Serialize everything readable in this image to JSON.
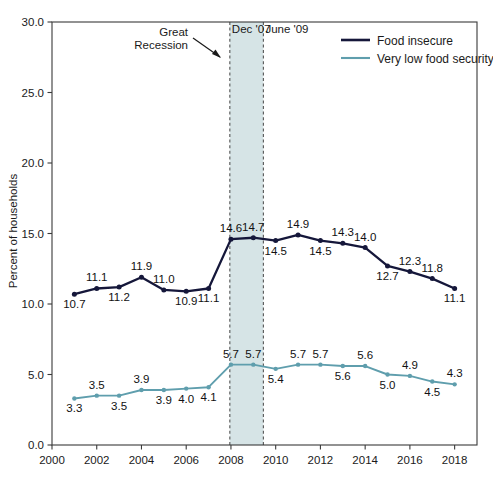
{
  "chart_data": {
    "type": "line",
    "title": "",
    "xlabel": "",
    "ylabel": "Percent of households",
    "xlim": [
      2000,
      2019
    ],
    "ylim": [
      0.0,
      30.0
    ],
    "grid": false,
    "legend_position": "top-right",
    "x": [
      2001,
      2002,
      2003,
      2004,
      2005,
      2006,
      2007,
      2008,
      2009,
      2010,
      2011,
      2012,
      2013,
      2014,
      2015,
      2016,
      2017,
      2018
    ],
    "xticks": [
      "2000",
      "2002",
      "2004",
      "2006",
      "2008",
      "2010",
      "2012",
      "2014",
      "2016",
      "2018"
    ],
    "xtick_values": [
      2000,
      2002,
      2004,
      2006,
      2008,
      2010,
      2012,
      2014,
      2016,
      2018
    ],
    "yticks": [
      "0.0",
      "5.0",
      "10.0",
      "15.0",
      "20.0",
      "25.0",
      "30.0"
    ],
    "ytick_values": [
      0,
      5,
      10,
      15,
      20,
      25,
      30
    ],
    "series": [
      {
        "name": "Food insecure",
        "color": "#15173a",
        "values": [
          10.7,
          11.1,
          11.2,
          11.9,
          11.0,
          10.9,
          11.1,
          14.6,
          14.7,
          14.5,
          14.9,
          14.5,
          14.3,
          14.0,
          12.7,
          12.3,
          11.8,
          11.1
        ],
        "labels": [
          "10.7",
          "11.1",
          "11.2",
          "11.9",
          "11.0",
          "10.9",
          "11.1",
          "14.6",
          "14.7",
          "14.5",
          "14.9",
          "14.5",
          "14.3",
          "14.0",
          "12.7",
          "12.3",
          "11.8",
          "11.1"
        ],
        "label_positions": [
          "below",
          "above",
          "below",
          "above",
          "above",
          "below",
          "below",
          "above",
          "above",
          "below",
          "above",
          "below",
          "above",
          "above",
          "below",
          "above",
          "above",
          "below"
        ]
      },
      {
        "name": "Very low food security",
        "color": "#5f9ead",
        "values": [
          3.3,
          3.5,
          3.5,
          3.9,
          3.9,
          4.0,
          4.1,
          5.7,
          5.7,
          5.4,
          5.7,
          5.7,
          5.6,
          5.6,
          5.0,
          4.9,
          4.5,
          4.3
        ],
        "labels": [
          "3.3",
          "3.5",
          "3.5",
          "3.9",
          "3.9",
          "4.0",
          "4.1",
          "5.7",
          "5.7",
          "5.4",
          "5.7",
          "5.7",
          "5.6",
          "5.6",
          "5.0",
          "4.9",
          "4.5",
          "4.3"
        ],
        "label_positions": [
          "below",
          "above",
          "below",
          "above",
          "below",
          "below",
          "below",
          "above",
          "above",
          "below",
          "above",
          "above",
          "below",
          "above",
          "below",
          "above",
          "below",
          "above"
        ]
      }
    ],
    "annotations": {
      "recession_band": {
        "label": "Great Recession",
        "label_line1": "Great",
        "label_line2": "Recession",
        "start_label": "Dec '07",
        "end_label": "June '09",
        "start_value": 2007.95,
        "end_value": 2009.45,
        "fill_color": "#cfdfe2",
        "border_color": "#555555"
      }
    }
  },
  "legend": {
    "items": [
      {
        "label": "Food insecure",
        "color": "#15173a"
      },
      {
        "label": "Very low food security",
        "color": "#5f9ead"
      }
    ]
  }
}
